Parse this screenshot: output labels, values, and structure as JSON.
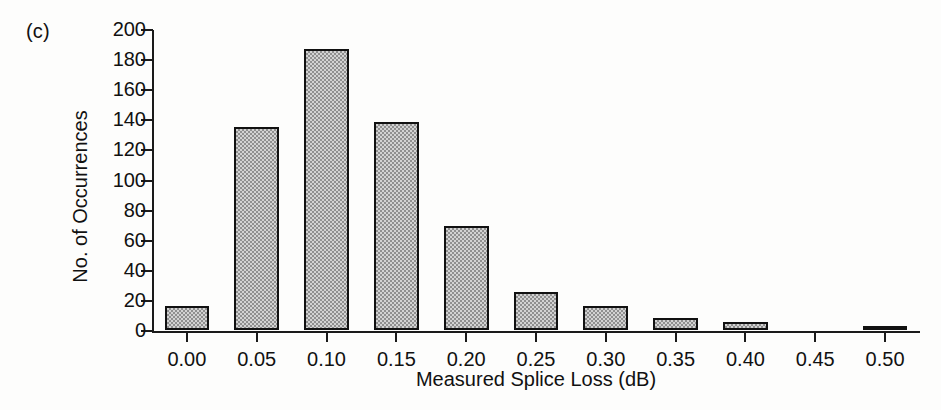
{
  "figure": {
    "panel_label": "(c)",
    "background_color": "#fdfdfc",
    "axis_color": "#1a1a1a",
    "bar_fill_color": "#a8a8a8",
    "bar_edge_color": "#111111"
  },
  "chart_data": {
    "type": "bar",
    "title": "",
    "subtitle": "",
    "panel": "(c)",
    "xlabel": "Measured Splice Loss (dB)",
    "ylabel": "No. of Occurrences",
    "categories": [
      "0.00",
      "0.05",
      "0.10",
      "0.15",
      "0.20",
      "0.25",
      "0.30",
      "0.35",
      "0.40",
      "0.45",
      "0.50"
    ],
    "x": [
      0.0,
      0.05,
      0.1,
      0.15,
      0.2,
      0.25,
      0.3,
      0.35,
      0.4,
      0.45,
      0.5
    ],
    "values": [
      16,
      135,
      187,
      138,
      69,
      25,
      16,
      8,
      5,
      0,
      3
    ],
    "xlim": [
      -0.025,
      0.525
    ],
    "ylim": [
      0,
      200
    ],
    "yticks": [
      0,
      20,
      40,
      60,
      80,
      100,
      120,
      140,
      160,
      180,
      200
    ],
    "ytick_labels": [
      "0",
      "20",
      "40",
      "60",
      "80",
      "100",
      "120",
      "140",
      "160",
      "180",
      "200"
    ],
    "xticks": [
      0.0,
      0.05,
      0.1,
      0.15,
      0.2,
      0.25,
      0.3,
      0.35,
      0.4,
      0.45,
      0.5
    ],
    "xtick_labels": [
      "0.00",
      "0.05",
      "0.10",
      "0.15",
      "0.20",
      "0.25",
      "0.30",
      "0.35",
      "0.40",
      "0.45",
      "0.50"
    ],
    "grid": false,
    "legend": false,
    "legend_position": "none",
    "bar_width": 0.032,
    "annotations": []
  }
}
